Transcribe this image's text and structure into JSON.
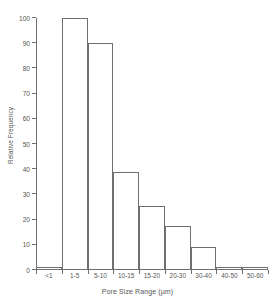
{
  "chart_data": {
    "type": "bar",
    "title": "",
    "subtitle": "",
    "xlabel": "Pore Size Range (µm)",
    "ylabel": "Relative Frequency",
    "categories": [
      "<1",
      "1-5",
      "5-10",
      "10-15",
      "15-20",
      "20-30",
      "30-40",
      "40-50",
      "50-60"
    ],
    "values": [
      1,
      100,
      90,
      39,
      25.5,
      17.5,
      9,
      1,
      1
    ],
    "ylim": [
      0,
      100
    ],
    "yticks": [
      0,
      10,
      20,
      30,
      40,
      50,
      60,
      70,
      80,
      90,
      100
    ],
    "ytick_labels": [
      "0",
      "10",
      "20",
      "30",
      "40",
      "50",
      "60",
      "70",
      "80",
      "90",
      "100"
    ],
    "grid": false,
    "legend": null,
    "bar_style": {
      "fill": "none",
      "edge_color": "#6f6f6f",
      "edge_width": 1
    },
    "annotations": []
  },
  "figure": {
    "background_color": "#ffffff",
    "axis_color": "#6f6f6f",
    "text_color": "#555555"
  }
}
